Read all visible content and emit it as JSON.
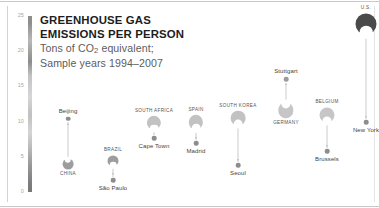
{
  "title": {
    "line1": "GREENHOUSE GAS",
    "line2": "EMISSIONS PER PERSON",
    "subtitle1_pre": "Tons of CO",
    "subtitle1_sub": "2",
    "subtitle1_post": " equivalent;",
    "subtitle2": "Sample years 1994–2007"
  },
  "axis": {
    "unit": "Tons of CO2 equivalent per person",
    "min": 0,
    "max": 25,
    "ticks": [
      {
        "value": 25,
        "label": "25"
      },
      {
        "value": 20,
        "label": "20"
      },
      {
        "value": 15,
        "label": "15"
      },
      {
        "value": 10,
        "label": "10"
      },
      {
        "value": 5,
        "label": "5"
      },
      {
        "value": 0,
        "label": "0"
      }
    ]
  },
  "colors": {
    "country_light": "#cfcfcf",
    "country_mid": "#9a9a9a",
    "country_dark": "#4a4a4a",
    "city_dot": "#8d8d8d",
    "city_dot_dark": "#5a5a5a",
    "stem": "#cccccc",
    "axis_text": "#a8a8a8",
    "title_text": "#1d1d1d",
    "subtitle_text": "#5d5d5d"
  },
  "chart_data": {
    "type": "scatter",
    "title": "GREENHOUSE GAS EMISSIONS PER PERSON",
    "subtitle": "Tons of CO2 equivalent; Sample years 1994–2007",
    "xlabel": "",
    "ylabel": "Tons of CO2 equivalent",
    "ylim": [
      0,
      25
    ],
    "grid": false,
    "legend": "none",
    "note": "Each pair shows a country value (large disc) and one of its cities (small dot), joined by an arrow.",
    "pairs": [
      {
        "country": "CHINA",
        "country_value": 4.0,
        "city": "Beijing",
        "city_value": 10.4,
        "direction": "up",
        "country_x": 68,
        "city_x": 68
      },
      {
        "country": "BRAZIL",
        "country_value": 4.4,
        "city": "São Paulo",
        "city_value": 1.7,
        "direction": "down",
        "country_x": 113,
        "city_x": 113
      },
      {
        "country": "SOUTH AFRICA",
        "country_value": 9.8,
        "city": "Cape Town",
        "city_value": 7.6,
        "direction": "down",
        "country_x": 154,
        "city_x": 154
      },
      {
        "country": "SPAIN",
        "country_value": 9.9,
        "city": "Madrid",
        "city_value": 6.9,
        "direction": "down",
        "country_x": 196,
        "city_x": 196
      },
      {
        "country": "SOUTH KOREA",
        "country_value": 10.5,
        "city": "Seoul",
        "city_value": 3.8,
        "direction": "down",
        "country_x": 238,
        "city_x": 238
      },
      {
        "country": "GERMANY",
        "country_value": 11.6,
        "city": "Stuttgart",
        "city_value": 16.0,
        "direction": "up",
        "country_x": 286,
        "city_x": 286
      },
      {
        "country": "BELGIUM",
        "country_value": 11.0,
        "city": "Brussels",
        "city_value": 5.8,
        "direction": "down",
        "country_x": 327,
        "city_x": 327
      },
      {
        "country": "U.S.",
        "country_value": 23.9,
        "city": "New York",
        "city_value": 9.9,
        "direction": "down",
        "country_x": 366,
        "city_x": 366
      }
    ]
  }
}
